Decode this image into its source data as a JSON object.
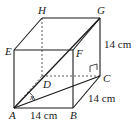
{
  "figure": {
    "type": "cuboid-3d-diagram",
    "vertices": {
      "A": {
        "label": "A",
        "x": 14,
        "y": 108
      },
      "B": {
        "label": "B",
        "x": 73,
        "y": 108
      },
      "C": {
        "label": "C",
        "x": 100,
        "y": 76
      },
      "D": {
        "label": "D",
        "x": 42,
        "y": 76
      },
      "E": {
        "label": "E",
        "x": 14,
        "y": 50
      },
      "F": {
        "label": "F",
        "x": 73,
        "y": 50
      },
      "G": {
        "label": "G",
        "x": 100,
        "y": 18
      },
      "H": {
        "label": "H",
        "x": 42,
        "y": 18
      }
    },
    "dimensions": {
      "AB": "14 cm",
      "BC": "14 cm",
      "CG": "14 cm"
    },
    "angle_label": "x",
    "colors": {
      "stroke": "#1a1a1a",
      "background": "#ffffff"
    }
  }
}
